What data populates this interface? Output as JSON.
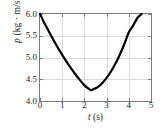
{
  "chart_data": {
    "type": "line",
    "title": "",
    "xlabel": "t (s)",
    "ylabel": "p (kg · m/s)",
    "xlabel_parts": {
      "variable": "t",
      "units": "(s)"
    },
    "ylabel_parts": {
      "variable": "p",
      "units": "(kg · m/s)"
    },
    "xlim": [
      0,
      5
    ],
    "ylim": [
      4.0,
      6.0
    ],
    "xticks": [
      0,
      1,
      2,
      3,
      4,
      5
    ],
    "xtick_labels": [
      "0",
      "1",
      "2",
      "3",
      "4",
      "5"
    ],
    "yticks": [
      4.0,
      4.5,
      5.0,
      5.5,
      6.0
    ],
    "ytick_labels": [
      "4.0",
      "4.5",
      "5.0",
      "5.5",
      "6.0"
    ],
    "grid": true,
    "grid_color": "#d9d9d9",
    "legend": null,
    "series": [
      {
        "name": "momentum",
        "color": "#000000",
        "line_width": 2.2,
        "x": [
          0.0,
          0.2,
          0.4,
          0.6,
          0.8,
          1.0,
          1.2,
          1.4,
          1.6,
          1.8,
          2.0,
          2.2,
          2.3,
          2.4,
          2.6,
          2.8,
          3.0,
          3.2,
          3.4,
          3.6,
          3.8,
          4.0,
          4.2,
          4.4,
          4.58
        ],
        "y": [
          6.0,
          5.79,
          5.6,
          5.41,
          5.23,
          5.06,
          4.9,
          4.75,
          4.61,
          4.48,
          4.36,
          4.28,
          4.25,
          4.27,
          4.32,
          4.41,
          4.53,
          4.68,
          4.86,
          5.07,
          5.31,
          5.58,
          5.74,
          5.92,
          6.0
        ]
      }
    ],
    "annotations": []
  },
  "axes": {
    "frame_color": "#7a7a7a",
    "tick_color": "#7a7a7a"
  }
}
